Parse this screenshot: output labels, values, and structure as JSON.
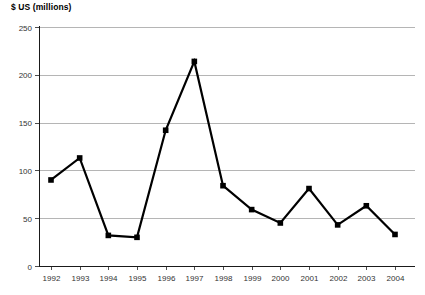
{
  "chart_data": {
    "type": "line",
    "title": "$ US (millions)",
    "xlabel": "",
    "ylabel": "$ US (millions)",
    "categories": [
      "1992",
      "1993",
      "1994",
      "1995",
      "1996",
      "1997",
      "1998",
      "1999",
      "2000",
      "2001",
      "2002",
      "2003",
      "2004"
    ],
    "values": [
      90,
      113,
      32,
      30,
      142,
      214,
      84,
      59,
      45,
      81,
      43,
      63,
      33
    ],
    "ylim": [
      0,
      250
    ],
    "ytick_labels": [
      "0",
      "50",
      "100",
      "150",
      "200",
      "250"
    ],
    "ytick_values": [
      0,
      50,
      100,
      150,
      200,
      250
    ],
    "grid": true,
    "legend": false,
    "series_name": "$ US (millions)",
    "line_color": "#000000",
    "marker_color": "#000000",
    "marker_shape": "square",
    "grid_color": "#b5b5b5",
    "axis_color": "#1a1a1a",
    "background_color": "#ffffff"
  }
}
